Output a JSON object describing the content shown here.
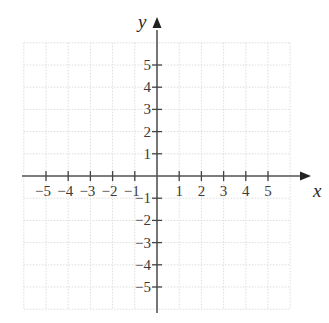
{
  "diagram": {
    "type": "coordinate-plane",
    "x_axis": {
      "label": "x",
      "ticks": [
        -5,
        -4,
        -3,
        -2,
        -1,
        1,
        2,
        3,
        4,
        5
      ]
    },
    "y_axis": {
      "label": "y",
      "ticks": [
        5,
        4,
        3,
        2,
        1,
        -1,
        -2,
        -3,
        -4,
        -5
      ]
    },
    "grid": {
      "on": true,
      "style": "dotted",
      "range": [
        -6,
        6
      ]
    },
    "colors": {
      "axis": "#555555",
      "grid": "#dddddd",
      "text": "#3a3a3a"
    }
  },
  "chart_data": {
    "type": "scatter",
    "title": "",
    "xlabel": "x",
    "ylabel": "y",
    "xlim": [
      -6,
      6
    ],
    "ylim": [
      -6,
      6
    ],
    "x_ticks": [
      -5,
      -4,
      -3,
      -2,
      -1,
      1,
      2,
      3,
      4,
      5
    ],
    "y_ticks": [
      -5,
      -4,
      -3,
      -2,
      -1,
      1,
      2,
      3,
      4,
      5
    ],
    "grid": true,
    "series": []
  }
}
